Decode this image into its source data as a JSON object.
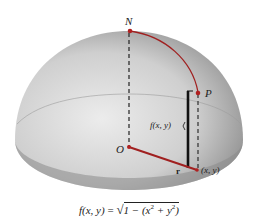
{
  "figure": {
    "labels": {
      "north": "N",
      "point": "P",
      "origin": "O",
      "radius": "r",
      "height": "f(x, y)",
      "base_point": "(x, y)"
    },
    "formula": {
      "lhs": "f(x, y)",
      "eq": "=",
      "radical": "√",
      "inside_prefix": "1 − (x",
      "exp1": "2",
      "mid": " + y",
      "exp2": "2",
      "suffix": ")"
    },
    "colors": {
      "accent": "#a02020",
      "surface_light": "#e6e6e6",
      "surface_dark": "#7a7a7a",
      "line": "#111111"
    }
  }
}
